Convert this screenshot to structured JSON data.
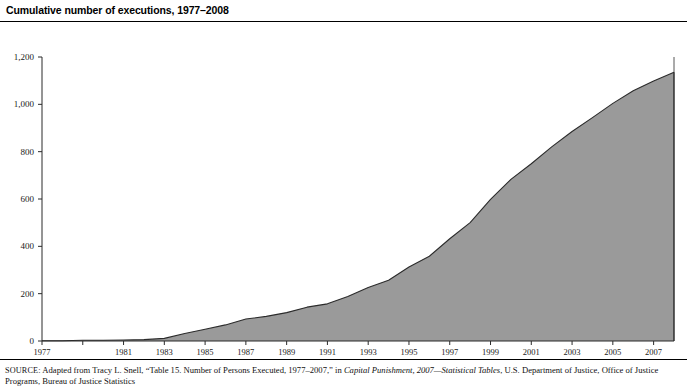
{
  "chart_data": {
    "type": "area",
    "title": "Cumulative number of executions, 1977–2008",
    "xlabel": "",
    "ylabel": "",
    "xlim": [
      1977,
      2008
    ],
    "ylim": [
      0,
      1200
    ],
    "grid": false,
    "legend": "none",
    "fill_color": "#9a9a9a",
    "line_color": "#2b2b2b",
    "x": [
      1977,
      1978,
      1979,
      1980,
      1981,
      1982,
      1983,
      1984,
      1985,
      1986,
      1987,
      1988,
      1989,
      1990,
      1991,
      1992,
      1993,
      1994,
      1995,
      1996,
      1997,
      1998,
      1999,
      2000,
      2001,
      2002,
      2003,
      2004,
      2005,
      2006,
      2007,
      2008
    ],
    "values": [
      1,
      1,
      3,
      3,
      4,
      6,
      11,
      32,
      50,
      68,
      93,
      104,
      120,
      143,
      157,
      188,
      226,
      257,
      313,
      358,
      432,
      500,
      598,
      683,
      749,
      820,
      885,
      944,
      1004,
      1057,
      1099,
      1136
    ],
    "y_ticks": [
      0,
      200,
      400,
      600,
      800,
      1000,
      1200
    ],
    "y_tick_labels": [
      "0",
      "200",
      "400",
      "600",
      "800",
      "1,000",
      "1,200"
    ],
    "x_ticks": [
      1977,
      1979,
      1981,
      1983,
      1985,
      1987,
      1989,
      1991,
      1993,
      1995,
      1997,
      1999,
      2001,
      2003,
      2005,
      2007
    ],
    "x_tick_labels": [
      "1977",
      "",
      "1981",
      "1983",
      "1985",
      "1987",
      "1989",
      "1991",
      "1993",
      "1995",
      "1997",
      "1999",
      "2001",
      "2003",
      "2005",
      "2007"
    ]
  },
  "source": {
    "label": "SOURCE:",
    "line1_a": " Adapted from Tracy L. Snell, “Table 15. Number of Persons Executed, 1977–2007,” in ",
    "line1_italic": "Capital Punishment, 2007—Statistical Tables",
    "line1_b": ", U.S.",
    "line2": "Department of Justice, Office of Justice Programs, Bureau of Justice Statistics"
  }
}
